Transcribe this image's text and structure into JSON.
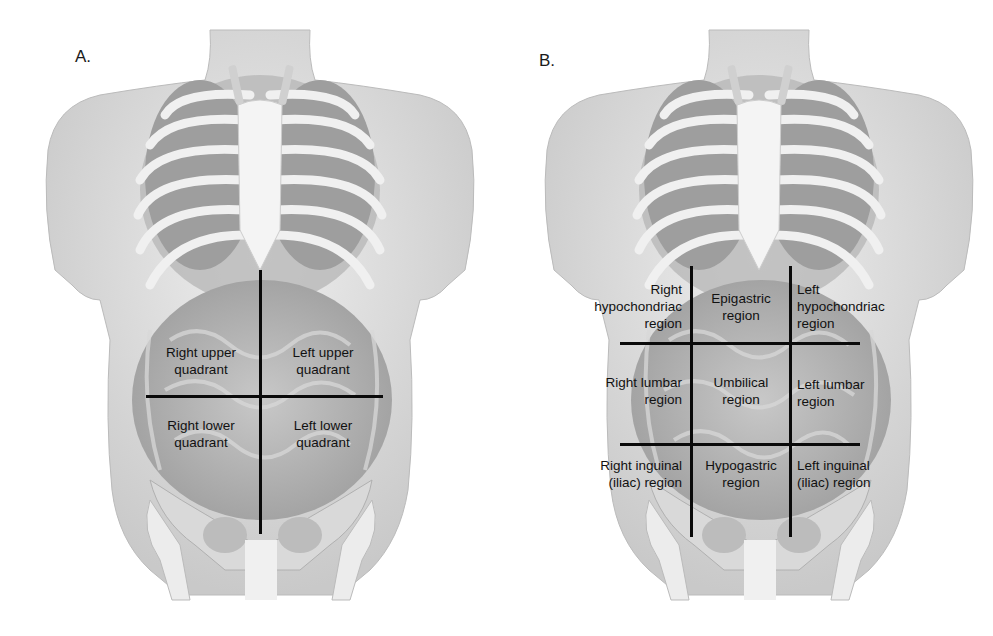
{
  "figure": {
    "panels": [
      {
        "letter": "A.",
        "scheme": "four quadrants",
        "labels": [
          {
            "lines": [
              "Right upper",
              "quadrant"
            ]
          },
          {
            "lines": [
              "Left upper",
              "quadrant"
            ]
          },
          {
            "lines": [
              "Right lower",
              "quadrant"
            ]
          },
          {
            "lines": [
              "Left lower",
              "quadrant"
            ]
          }
        ]
      },
      {
        "letter": "B.",
        "scheme": "nine regions",
        "labels": [
          {
            "lines": [
              "Right",
              "hypochondriac",
              "region"
            ]
          },
          {
            "lines": [
              "Epigastric",
              "region"
            ]
          },
          {
            "lines": [
              "Left",
              "hypochondriac",
              "region"
            ]
          },
          {
            "lines": [
              "Right lumbar",
              "region"
            ]
          },
          {
            "lines": [
              "Umbilical",
              "region"
            ]
          },
          {
            "lines": [
              "Left lumbar",
              "region"
            ]
          },
          {
            "lines": [
              "Right inguinal",
              "(iliac) region"
            ]
          },
          {
            "lines": [
              "Hypogastric",
              "region"
            ]
          },
          {
            "lines": [
              "Left inguinal",
              "(iliac) region"
            ]
          }
        ]
      }
    ],
    "colors": {
      "background": "#ffffff",
      "skin": "#e6e6e6",
      "skin_shadow": "#bdbdbd",
      "bone": "#f2f2f2",
      "organ": "#a8a8a8",
      "divider_line": "#0a0a0a",
      "text": "#111111"
    }
  }
}
